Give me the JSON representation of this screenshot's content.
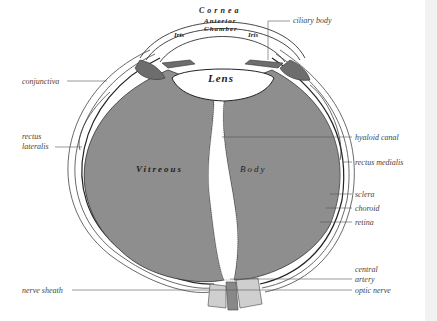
{
  "diagram": {
    "colors": {
      "background": "#ffffff",
      "vitreous": "#8e8e8e",
      "outline": "#333333",
      "lens": "#ffffff",
      "label_text": "#444444"
    },
    "inner_labels": {
      "cornea": "Cornea",
      "anterior": "Anterior",
      "chamber": "Chamber",
      "iris_left": "Iris",
      "iris_right": "Iris",
      "lens": "Lens",
      "vitreous": "Vitreous",
      "body": "Body"
    },
    "callouts": {
      "ciliary_body": "ciliary body",
      "conjunctiva": "conjunctiva",
      "rectus_lateralis_1": "rectus",
      "rectus_lateralis_2": "lateralis",
      "hyaloid_canal": "hyaloid canal",
      "rectus_medialis": "rectus medialis",
      "sclera": "sclera",
      "choroid": "choroid",
      "retina": "retina",
      "central_artery_1": "central",
      "central_artery_2": "artery",
      "optic_nerve": "optic nerve",
      "nerve_sheath": "nerve sheath"
    }
  }
}
